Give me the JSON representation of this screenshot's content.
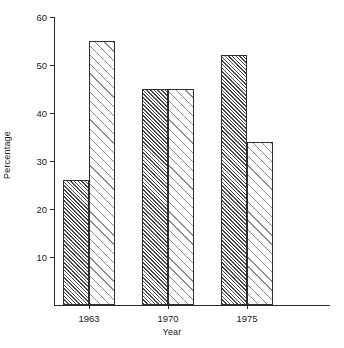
{
  "chart_data": {
    "type": "bar",
    "title": "",
    "subtitle": "",
    "xlabel": "Year",
    "ylabel": "Percentage",
    "categories": [
      "1963",
      "1970",
      "1975"
    ],
    "series": [
      {
        "name": "series-1",
        "pattern": "dense-diagonal-hatch",
        "values": [
          26,
          45,
          52
        ]
      },
      {
        "name": "series-2",
        "pattern": "sparse-diagonal-hatch",
        "values": [
          55,
          45,
          34
        ]
      }
    ],
    "ylim": [
      0,
      60
    ],
    "yticks": [
      0,
      10,
      20,
      30,
      40,
      50,
      60
    ],
    "ytick_labels": [
      "",
      "10",
      "20",
      "30",
      "40",
      "50",
      "60"
    ],
    "grid": false,
    "legend": "none",
    "bar_grouping": "paired-adjacent",
    "axis_style": "left-and-bottom-spines"
  },
  "axes": {
    "y_label": "Percentage",
    "x_label": "Year",
    "y_ticks": [
      {
        "value": 60,
        "label": "60"
      },
      {
        "value": 50,
        "label": "50"
      },
      {
        "value": 40,
        "label": "40"
      },
      {
        "value": 30,
        "label": "30"
      },
      {
        "value": 20,
        "label": "20"
      },
      {
        "value": 10,
        "label": "10"
      }
    ],
    "x_ticks": [
      {
        "label": "1963"
      },
      {
        "label": "1970"
      },
      {
        "label": "1975"
      }
    ]
  },
  "colors": {
    "axis": "#2a2a2a",
    "bar_outline": "#2f2f2f",
    "hatch_dense": "#4a4a4a",
    "hatch_sparse": "#8c8c8c",
    "background": "#ffffff",
    "text": "#222222"
  }
}
